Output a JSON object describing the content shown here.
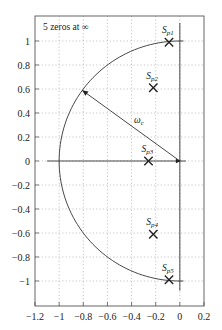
{
  "chart_data": {
    "type": "scatter",
    "title": "",
    "xlabel": "",
    "ylabel": "",
    "xlim": [
      -1.2,
      0.2
    ],
    "ylim": [
      -1.2,
      1.15
    ],
    "grid": true,
    "x_ticks": [
      -1.2,
      -1,
      -0.8,
      -0.6,
      -0.4,
      -0.2,
      0,
      0.2
    ],
    "x_tick_labels": [
      "-1.2",
      "-1",
      "-0.8",
      "-0.6",
      "-0.4",
      "-0.2",
      "0",
      "0.2"
    ],
    "y_ticks": [
      1,
      0.8,
      0.6,
      0.4,
      0.2,
      0,
      -0.2,
      -0.4,
      -0.6,
      -0.8,
      -1
    ],
    "y_tick_labels": [
      "1",
      "0.8",
      "0.6",
      "0.4",
      "0.2",
      "0",
      "-0.2",
      "-0.4",
      "-0.6",
      "-0.8",
      "-1"
    ],
    "annotation": "5 zeros at ∞",
    "series": [
      {
        "name": "poles",
        "marker": "x",
        "points": [
          {
            "label": "S",
            "sub": "p1",
            "x": -0.09,
            "y": 0.99
          },
          {
            "label": "S",
            "sub": "p2",
            "x": -0.22,
            "y": 0.61
          },
          {
            "label": "S",
            "sub": "p3",
            "x": -0.26,
            "y": 0.0
          },
          {
            "label": "S",
            "sub": "p4",
            "x": -0.22,
            "y": -0.61
          },
          {
            "label": "S",
            "sub": "p5",
            "x": -0.09,
            "y": -0.99
          }
        ]
      }
    ],
    "shapes": {
      "semicircle": {
        "center": [
          0,
          0
        ],
        "radius": 1,
        "from_deg": 90,
        "to_deg": 270
      },
      "radius_arrow": {
        "from": [
          0,
          0
        ],
        "to": [
          -0.81,
          0.59
        ],
        "label": "ω",
        "label_sub": "c"
      }
    }
  }
}
